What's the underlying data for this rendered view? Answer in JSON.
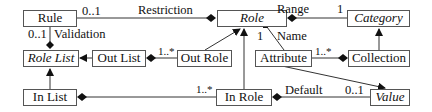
{
  "classes": {
    "rule": {
      "label": "Rule",
      "abstract": false
    },
    "role": {
      "label": "Role",
      "abstract": true
    },
    "category": {
      "label": "Category",
      "abstract": true
    },
    "role_list": {
      "label": "Role List",
      "abstract": true
    },
    "out_list": {
      "label": "Out List",
      "abstract": false
    },
    "out_role": {
      "label": "Out Role",
      "abstract": false
    },
    "attribute": {
      "label": "Attribute",
      "abstract": false
    },
    "collection": {
      "label": "Collection",
      "abstract": false
    },
    "in_list": {
      "label": "In List",
      "abstract": false
    },
    "in_role": {
      "label": "In Role",
      "abstract": false
    },
    "value": {
      "label": "Value",
      "abstract": true
    }
  },
  "associations": {
    "restriction": {
      "name": "Restriction",
      "mult_rule_end": "0..1"
    },
    "validation": {
      "name": "Validation",
      "mult": "0..1"
    },
    "range": {
      "name": "Range",
      "mult": "1"
    },
    "name": {
      "name": "Name",
      "mult": "1"
    },
    "out_list_out_role": {
      "mult": "1..*"
    },
    "attribute_collection": {
      "mult": "1..*"
    },
    "in_list_in_role": {
      "mult": "1..*"
    },
    "default": {
      "name": "Default",
      "mult": "0..1"
    }
  },
  "generalizations": [
    {
      "child": "Out Role",
      "parent": "Role"
    },
    {
      "child": "In Role",
      "parent": "Role"
    },
    {
      "child": "Out List",
      "parent": "Role List"
    },
    {
      "child": "In List",
      "parent": "Role List"
    },
    {
      "child": "Collection",
      "parent": "Category"
    },
    {
      "child": "Attribute",
      "parent": "Value"
    }
  ]
}
